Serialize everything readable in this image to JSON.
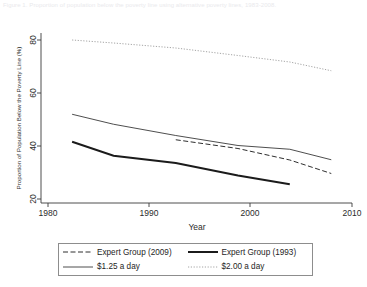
{
  "caption": {
    "text": "Figure 1. Proportion of population below the poverty line using alternative poverty lines, 1983-2008."
  },
  "chart_data": {
    "type": "line",
    "title": "",
    "xlabel": "Year",
    "ylabel": "Proportion of Population Below the Poverty Line (%)",
    "xlim": [
      1980,
      2010
    ],
    "ylim": [
      20,
      88
    ],
    "xticks": [
      1980,
      1990,
      2000,
      2010
    ],
    "yticks": [
      20,
      40,
      60,
      80
    ],
    "xticklabels": [
      "1980",
      "1990",
      "2000",
      "2010"
    ],
    "yticklabels": [
      "20",
      "40",
      "60",
      "80"
    ],
    "grid": false,
    "legend_position": "below-outside",
    "series": [
      {
        "name": "Expert Group (2009)",
        "style": "dashed",
        "color": "#2f2f2f",
        "x": [
          1993,
          1999,
          2004,
          2008
        ],
        "values": [
          45.3,
          41.8,
          37.2,
          31.8
        ]
      },
      {
        "name": "Expert Group (1993)",
        "style": "solid-thick",
        "color": "#1b1b1b",
        "x": [
          1983,
          1987,
          1993,
          1999,
          2004
        ],
        "values": [
          44.5,
          38.9,
          36.0,
          31.0,
          27.5
        ]
      },
      {
        "name": "$1.25 a day",
        "style": "solid-thin",
        "color": "#3a3a3a",
        "x": [
          1983,
          1987,
          1993,
          1999,
          2004,
          2008
        ],
        "values": [
          55.5,
          51.5,
          47.0,
          43.0,
          41.5,
          37.3
        ]
      },
      {
        "name": "$2.00 a day",
        "style": "dotted",
        "color": "#9a9a9a",
        "x": [
          1983,
          1987,
          1993,
          1999,
          2004,
          2008
        ],
        "values": [
          85.2,
          84.0,
          82.0,
          79.0,
          76.4,
          72.9
        ]
      }
    ]
  },
  "axes": {
    "x_title": "Year",
    "y_title": "Proportion of Population Below the Poverty Line (%)",
    "x_tick_1": "1980",
    "x_tick_2": "1990",
    "x_tick_3": "2000",
    "x_tick_4": "2010",
    "y_tick_1": "20",
    "y_tick_2": "40",
    "y_tick_3": "60",
    "y_tick_4": "80"
  },
  "legend": {
    "items": [
      {
        "label": "Expert Group (2009)",
        "style": "dashed"
      },
      {
        "label": "Expert Group (1993)",
        "style": "solid-thick"
      },
      {
        "label": "$1.25 a day",
        "style": "solid-thin"
      },
      {
        "label": "$2.00 a day",
        "style": "dotted"
      }
    ]
  },
  "colors": {
    "axis": "#3b3b3b",
    "eg2009": "#2f2f2f",
    "eg1993": "#1b1b1b",
    "d125": "#3a3a3a",
    "d200": "#9a9a9a",
    "background": "#ffffff",
    "legend_border": "#8d8d8d"
  }
}
